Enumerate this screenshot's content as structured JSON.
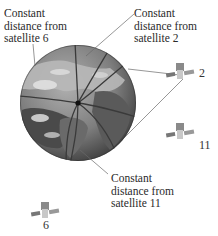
{
  "diagram": {
    "title": "",
    "globe": {
      "center": [
        78,
        103
      ],
      "radius": 58,
      "intersection": [
        78,
        103
      ]
    },
    "labels": [
      {
        "id": "sat6",
        "lines": [
          "Constant",
          "distance from",
          "satellite 6"
        ]
      },
      {
        "id": "sat2",
        "lines": [
          "Constant",
          "distance from",
          "satellite 2"
        ]
      },
      {
        "id": "sat11",
        "lines": [
          "Constant",
          "distance from",
          "satellite 11"
        ]
      }
    ],
    "satellites": [
      {
        "id": "2",
        "label": "2",
        "position": [
          180,
          73
        ]
      },
      {
        "id": "11",
        "label": "11",
        "position": [
          180,
          133
        ]
      },
      {
        "id": "6",
        "label": "6",
        "position": [
          45,
          212
        ]
      }
    ],
    "colors": {
      "ocean": "#8a8a8a",
      "land_dark": "#4a4a4a",
      "land_light": "#b5b5b5",
      "cloud": "#e6e6e6",
      "circle_line": "#3a3a3a",
      "leader_line": "#6a6a6a",
      "text": "#2a2a2a"
    }
  }
}
